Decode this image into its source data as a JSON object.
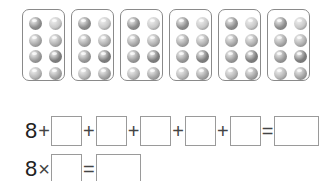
{
  "cards": {
    "count": 6,
    "balls_per_card": 8,
    "ball_shades": [
      "#8e8e8e",
      "#c8c8c8",
      "#a9a9a9",
      "#b0b0b0",
      "#9a9a9a",
      "#7e7e7e",
      "#b6b6b6",
      "#a4a4a4"
    ]
  },
  "equation1": {
    "start": "8",
    "plus": "+",
    "equals": "=",
    "blank_count": 5,
    "answer_blank": ""
  },
  "equation2": {
    "start": "8",
    "times": "×",
    "equals": "=",
    "blank": "",
    "answer_blank": ""
  }
}
